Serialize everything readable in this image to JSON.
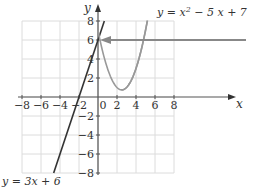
{
  "chart_data": {
    "type": "line",
    "title": "",
    "xlabel": "x",
    "ylabel": "y",
    "xlim": [
      -8,
      8
    ],
    "ylim": [
      -8,
      8
    ],
    "grid": true,
    "x_ticks": [
      -8,
      -6,
      -4,
      -2,
      0,
      2,
      4,
      6,
      8
    ],
    "y_ticks": [
      -8,
      -6,
      -4,
      -2,
      2,
      4,
      6,
      8
    ],
    "x_tick_labels": [
      "−8",
      "−6",
      "−4",
      "−2",
      "0",
      "2",
      "4",
      "6",
      "8"
    ],
    "y_tick_labels": [
      "−8",
      "−6",
      "−4",
      "−2",
      "2",
      "4",
      "6",
      "8"
    ],
    "series": [
      {
        "name": "y = 3x + 6",
        "label": "y = 3x + 6",
        "expression": "3x+6",
        "color": "#333333",
        "x": [
          -4.667,
          0.667
        ],
        "y": [
          -8,
          8
        ]
      },
      {
        "name": "y = x^2 - 5x + 7",
        "label_parts": [
          "y = x",
          "2",
          " − 5 x + 7"
        ],
        "expression": "x^2-5x+7",
        "color": "#999999",
        "x": [
          0,
          0.5,
          1,
          1.5,
          2,
          2.5,
          3,
          3.5,
          4,
          4.5,
          5,
          5.5,
          6
        ],
        "y": [
          7,
          4.75,
          3,
          1.75,
          1,
          0.75,
          1,
          1.75,
          3,
          4.75,
          7,
          9.75,
          13
        ]
      }
    ],
    "annotations": [
      {
        "type": "arrow",
        "from": [
          14.5,
          6
        ],
        "to": [
          0,
          6
        ],
        "color": "#888888",
        "note": "points to y-intercept (0, 6)"
      }
    ]
  },
  "labels": {
    "x_axis": "x",
    "y_axis": "y",
    "origin": "0",
    "line_eq": "y = 3x + 6",
    "parabola_eq_a": "y = x",
    "parabola_eq_sup": "2",
    "parabola_eq_b": " − 5 x + 7"
  }
}
